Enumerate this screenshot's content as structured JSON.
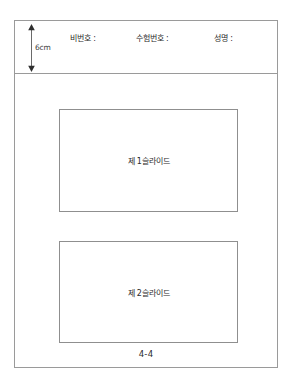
{
  "document": {
    "title": "실기 답안지 슬라이드 배치도",
    "page_number": "4-4"
  },
  "header": {
    "dimension": {
      "icon": "vertical-double-arrow-icon",
      "label": "6cm"
    },
    "fields": [
      {
        "label": "비번호 :"
      },
      {
        "label": "수험번호 :"
      },
      {
        "label": "성명 :"
      }
    ]
  },
  "body": {
    "slides": [
      {
        "caption": "제 1슬라이드"
      },
      {
        "caption": "제 2슬라이드"
      }
    ]
  },
  "footer": {
    "page_label": "4-4"
  },
  "colors": {
    "page_background": "#ffffff",
    "frame_border": "#9a9a9a",
    "slide_border": "#8f8f8f",
    "text": "#2b2b2b",
    "dimension_arrow": "#4a4a4a"
  }
}
